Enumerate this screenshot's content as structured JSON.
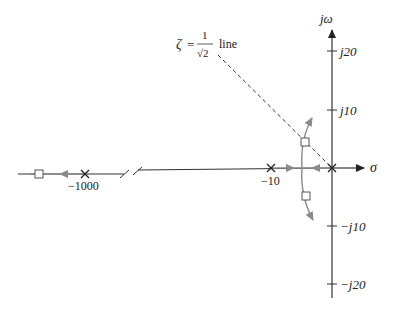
{
  "diagram": {
    "type": "root-locus",
    "axes": {
      "real_axis_label": "σ",
      "imag_axis_label": "jω",
      "imag_ticks": [
        "j20",
        "j10",
        "−j10",
        "−j20"
      ],
      "real_ticks": [
        "−10",
        "−1000"
      ]
    },
    "damping_line": {
      "zeta_symbol": "ζ",
      "equals": "=",
      "numerator": "1",
      "denominator": "√2",
      "suffix": "line"
    },
    "poles": [
      {
        "label": "−1000",
        "value": -1000
      },
      {
        "label": "−10",
        "value": -10
      },
      {
        "label": "",
        "value": 0
      }
    ],
    "closed_loop_markers": 3,
    "colors": {
      "axis": "#333333",
      "locus": "#8a8a8a",
      "dashed": "#333333",
      "marker_fill": "#ffffff"
    }
  }
}
